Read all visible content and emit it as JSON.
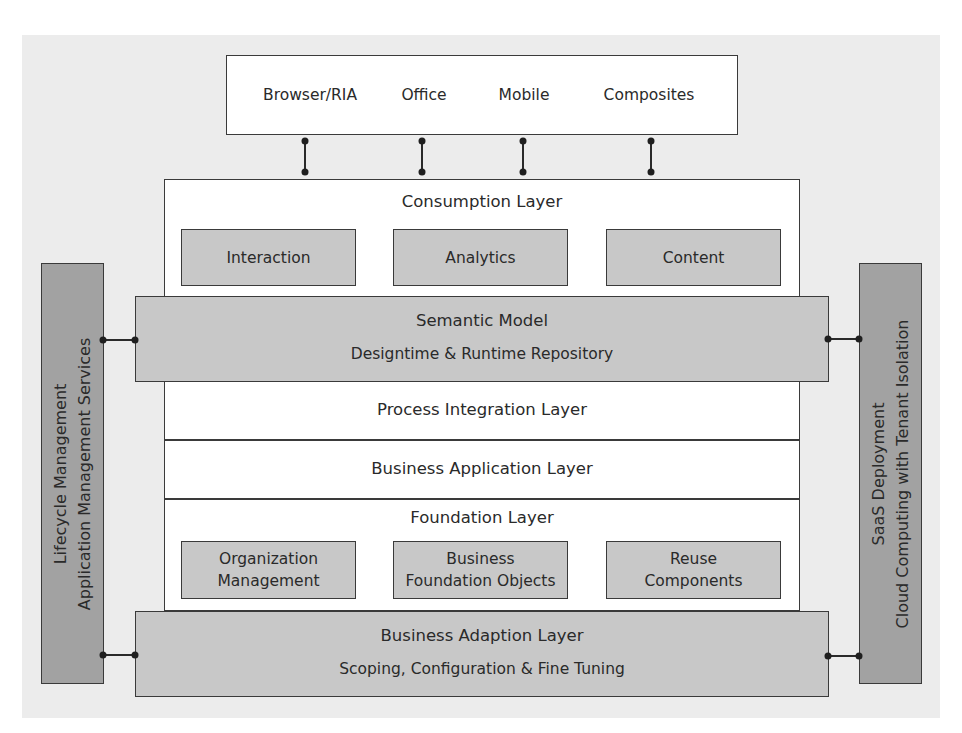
{
  "diagram": {
    "clients": {
      "items": [
        {
          "label": "Browser/RIA"
        },
        {
          "label": "Office"
        },
        {
          "label": "Mobile"
        },
        {
          "label": "Composites"
        }
      ]
    },
    "consumption_layer": {
      "title": "Consumption Layer",
      "components": [
        {
          "label": "Interaction"
        },
        {
          "label": "Analytics"
        },
        {
          "label": "Content"
        }
      ]
    },
    "semantic_model": {
      "title": "Semantic Model",
      "subtitle": "Designtime & Runtime Repository"
    },
    "process_integration_layer": {
      "title": "Process Integration Layer"
    },
    "business_application_layer": {
      "title": "Business Application Layer"
    },
    "foundation_layer": {
      "title": "Foundation Layer",
      "components": [
        {
          "line1": "Organization",
          "line2": "Management"
        },
        {
          "line1": "Business",
          "line2": "Foundation Objects"
        },
        {
          "line1": "Reuse",
          "line2": "Components"
        }
      ]
    },
    "business_adaption_layer": {
      "title": "Business Adaption Layer",
      "subtitle": "Scoping, Configuration & Fine Tuning"
    },
    "left_pillar": {
      "line1": "Lifecycle Management",
      "line2": "Application Management Services"
    },
    "right_pillar": {
      "line1": "SaaS Deployment",
      "line2": "Cloud Computing with Tenant Isolation"
    }
  },
  "colors": {
    "background": "#ececec",
    "white_box": "#ffffff",
    "light_grey_box": "#c8c8c8",
    "dark_grey_pillar": "#a2a2a2",
    "line": "#3a3a3a"
  }
}
